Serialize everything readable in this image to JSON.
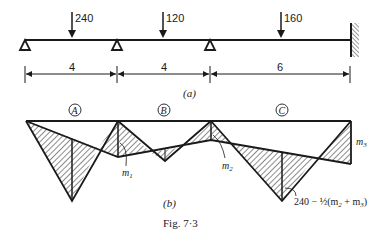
{
  "figure": {
    "caption": "Fig. 7·3",
    "part_a_label": "(a)",
    "part_b_label": "(b)"
  },
  "beam": {
    "loads": [
      {
        "value": "240",
        "x": 72
      },
      {
        "value": "120",
        "x": 163
      },
      {
        "value": "160",
        "x": 281
      }
    ],
    "supports": [
      {
        "type": "pin",
        "x": 25
      },
      {
        "type": "roller",
        "x": 117
      },
      {
        "type": "roller",
        "x": 210
      },
      {
        "type": "fixed",
        "x": 351
      }
    ],
    "spans": [
      "4",
      "4",
      "6"
    ]
  },
  "moment_diagram": {
    "span_labels": [
      "A",
      "B",
      "C"
    ],
    "annotations": {
      "m1": "m",
      "m1_sub": "1",
      "m2": "m",
      "m2_sub": "2",
      "m3": "m",
      "m3_sub": "3",
      "peak_c_prefix": "240 − ½(m",
      "peak_c_sub1": "2",
      "peak_c_mid": " + m",
      "peak_c_sub2": "3",
      "peak_c_suffix": ")"
    }
  },
  "colors": {
    "ink": "#1a1a1a",
    "background": "#ffffff"
  }
}
